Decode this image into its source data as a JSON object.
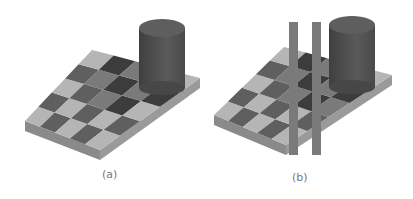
{
  "figure": {
    "panels": [
      {
        "label": "(a)",
        "variant": "checkerboard with cylinder shadow"
      },
      {
        "label": "(b)",
        "variant": "same scene with two vertical gray bars connecting squares A and B"
      }
    ],
    "square_labels": [
      "A",
      "B"
    ],
    "colors": {
      "light_square": "#b5b5b5",
      "dark_square": "#5f5f5f",
      "shadow_light": "#7a7a7a",
      "shadow_dark": "#3c3c3c",
      "cylinder": "#575757",
      "bar": "#7a7a7a"
    }
  }
}
